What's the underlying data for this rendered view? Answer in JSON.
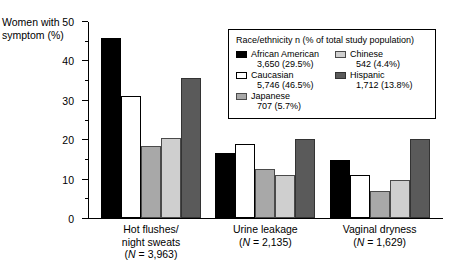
{
  "chart_data": {
    "type": "bar",
    "title": "",
    "xlabel": "",
    "ylabel": "Women with symptom (%)",
    "ylim": [
      0,
      50
    ],
    "ytick_step": 10,
    "yminor_step": 5,
    "grid": false,
    "legend_position": "top-right",
    "ytick_labels": [
      "0",
      "10",
      "20",
      "30",
      "40",
      "50"
    ],
    "categories": [
      "Hot flushes/ night sweats (N = 3,963)",
      "Urine leakage (N = 2,135)",
      "Vaginal dryness (N = 1,629)"
    ],
    "series": [
      {
        "name": "African American",
        "values": [
          45.8,
          16.5,
          14.7
        ]
      },
      {
        "name": "Caucasian",
        "values": [
          31.0,
          18.7,
          11.0
        ]
      },
      {
        "name": "Japanese",
        "values": [
          18.2,
          12.5,
          6.8
        ]
      },
      {
        "name": "Chinese",
        "values": [
          20.4,
          11.0,
          9.6
        ]
      },
      {
        "name": "Hispanic",
        "values": [
          35.5,
          20.0,
          20.0
        ]
      }
    ]
  },
  "axis": {
    "y_title_line1": "Women with",
    "y_title_line2": "symptom (%)",
    "ticks": [
      {
        "label": "50",
        "value": 50
      },
      {
        "label": "40",
        "value": 40
      },
      {
        "label": "30",
        "value": 30
      },
      {
        "label": "20",
        "value": 20
      },
      {
        "label": "10",
        "value": 10
      },
      {
        "label": "0",
        "value": 0
      }
    ]
  },
  "groups": [
    {
      "line1": "Hot flushes/",
      "line2": "night sweats",
      "n_prefix": "(",
      "n_italic": "N",
      "n_suffix": " = 3,963)"
    },
    {
      "line1": "Urine leakage",
      "line2": "",
      "n_prefix": "(",
      "n_italic": "N",
      "n_suffix": " = 2,135)"
    },
    {
      "line1": "Vaginal dryness",
      "line2": "",
      "n_prefix": "(",
      "n_italic": "N",
      "n_suffix": " = 1,629)"
    }
  ],
  "legend": {
    "title": "Race/ethnicity n (% of total study population)",
    "column_left": [
      {
        "name": "African American",
        "count": "3,650 (29.5%)",
        "swatch": "black"
      },
      {
        "name": "Caucasian",
        "count": "5,746 (46.5%)",
        "swatch": "white"
      },
      {
        "name": "Japanese",
        "count": "707 (5.7%)",
        "swatch": "midgray"
      }
    ],
    "column_right": [
      {
        "name": "Chinese",
        "count": "542 (4.4%)",
        "swatch": "ltgray"
      },
      {
        "name": "Hispanic",
        "count": "1,712 (13.8%)",
        "swatch": "dkgray"
      }
    ]
  },
  "colors": {
    "african_american": "#000000",
    "caucasian": "#ffffff",
    "japanese": "#a8a8a8",
    "chinese": "#cfcfcf",
    "hispanic": "#5a5a5a",
    "axis": "#000000"
  }
}
